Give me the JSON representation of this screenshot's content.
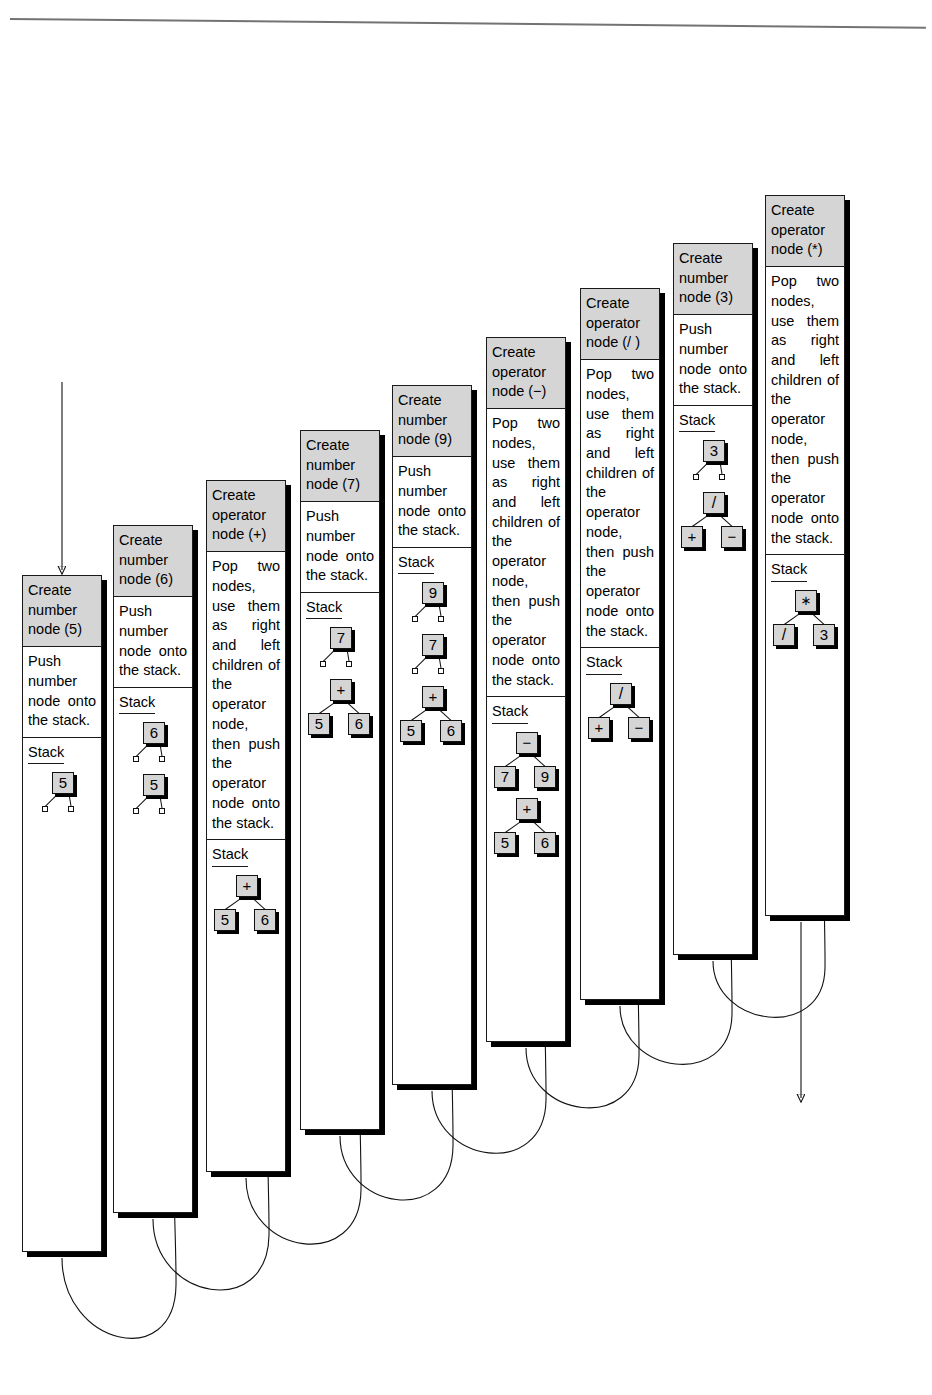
{
  "figure": {
    "expression_tokens": [
      "5",
      "6",
      "+",
      "7",
      "9",
      "-",
      "/",
      "3",
      "*"
    ],
    "stack_label": "Stack",
    "body_text_number": "Push number node onto the stack.",
    "body_text_operator": "Pop two nodes, use them as right and left children of the operator node, then push the operator node onto the stack."
  },
  "steps": [
    {
      "id": "step-1",
      "kind": "number",
      "header": "Create number node (5)",
      "body": "Push number node onto the stack.",
      "stack_label": "Stack",
      "stack": [
        {
          "value": "5",
          "left": null,
          "right": null,
          "leaf_children": true
        }
      ]
    },
    {
      "id": "step-2",
      "kind": "number",
      "header": "Create number node (6)",
      "body": "Push number node onto the stack.",
      "stack_label": "Stack",
      "stack": [
        {
          "value": "6",
          "left": null,
          "right": null,
          "leaf_children": true
        },
        {
          "value": "5",
          "left": null,
          "right": null,
          "leaf_children": true
        }
      ]
    },
    {
      "id": "step-3",
      "kind": "operator",
      "header": "Create operator node (+)",
      "body": "Pop two nodes, use them as right and left children of the operator node, then push the operator node onto the stack.",
      "stack_label": "Stack",
      "stack": [
        {
          "value": "+",
          "left": "5",
          "right": "6",
          "leaf_children": false
        }
      ]
    },
    {
      "id": "step-4",
      "kind": "number",
      "header": "Create number node (7)",
      "body": "Push number node onto the stack.",
      "stack_label": "Stack",
      "stack": [
        {
          "value": "7",
          "left": null,
          "right": null,
          "leaf_children": true
        },
        {
          "value": "+",
          "left": "5",
          "right": "6",
          "leaf_children": false
        }
      ]
    },
    {
      "id": "step-5",
      "kind": "number",
      "header": "Create number node (9)",
      "body": "Push number node onto the stack.",
      "stack_label": "Stack",
      "stack": [
        {
          "value": "9",
          "left": null,
          "right": null,
          "leaf_children": true
        },
        {
          "value": "7",
          "left": null,
          "right": null,
          "leaf_children": true
        },
        {
          "value": "+",
          "left": "5",
          "right": "6",
          "leaf_children": false
        }
      ]
    },
    {
      "id": "step-6",
      "kind": "operator",
      "header": "Create operator node (−)",
      "body": "Pop two nodes, use them as right and left children of the operator node, then push the operator node onto the stack.",
      "stack_label": "Stack",
      "stack": [
        {
          "value": "−",
          "left": "7",
          "right": "9",
          "leaf_children": false
        },
        {
          "value": "+",
          "left": "5",
          "right": "6",
          "leaf_children": false
        }
      ]
    },
    {
      "id": "step-7",
      "kind": "operator",
      "header": "Create operator node (/ )",
      "body": "Pop two nodes, use them as right and left children of the operator node, then push the operator node onto the stack.",
      "stack_label": "Stack",
      "stack": [
        {
          "value": "/",
          "left": "+",
          "right": "−",
          "leaf_children": false
        }
      ]
    },
    {
      "id": "step-8",
      "kind": "number",
      "header": "Create number node (3)",
      "body": "Push number node onto the stack.",
      "stack_label": "Stack",
      "stack": [
        {
          "value": "3",
          "left": null,
          "right": null,
          "leaf_children": true
        },
        {
          "value": "/",
          "left": "+",
          "right": "−",
          "leaf_children": false
        }
      ]
    },
    {
      "id": "step-9",
      "kind": "operator",
      "header": "Create operator node (*)",
      "body": "Pop two nodes, use them as right and left children of the operator node, then push the operator node onto the stack.",
      "stack_label": "Stack",
      "stack": [
        {
          "value": "*",
          "left": "/",
          "right": "3",
          "leaf_children": false
        }
      ]
    }
  ],
  "colors": {
    "header_fill": "#d5d5d5",
    "node_fill": "#d5d5d5",
    "stroke": "#111111",
    "shadow": "#000000",
    "page": "#ffffff"
  },
  "layout": {
    "card_width": 80,
    "card_x": [
      22,
      113,
      206,
      300,
      392,
      486,
      580,
      673,
      765
    ],
    "card_top": [
      575,
      525,
      480,
      430,
      385,
      337,
      288,
      243,
      195
    ],
    "card_bottom": [
      1252,
      1213,
      1172,
      1130,
      1085,
      1042,
      1000,
      955,
      916
    ]
  }
}
